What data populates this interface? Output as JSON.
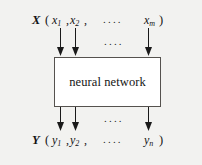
{
  "figure": {
    "background_color": "#f2f2f0",
    "box": {
      "label": "neural network",
      "fill_color": "#ffffff",
      "border_color": "#55524e"
    },
    "input_vector": {
      "name": "X",
      "open_paren": "(",
      "close_paren": ")",
      "terms": [
        {
          "base": "x",
          "sub": "1"
        },
        {
          "base": "x",
          "sub": "2"
        },
        {
          "base": "x",
          "sub": "m"
        }
      ],
      "comma": ",",
      "ellipsis": "...."
    },
    "output_vector": {
      "name": "Y",
      "open_paren": "(",
      "close_paren": ")",
      "terms": [
        {
          "base": "y",
          "sub": "1"
        },
        {
          "base": "y",
          "sub": "2"
        },
        {
          "base": "y",
          "sub": "n"
        }
      ],
      "comma": ",",
      "ellipsis": "...."
    },
    "input_arrows_ellipsis": "....",
    "output_arrows_ellipsis": "....",
    "arrow_color": "#1a1a1a",
    "input_arrows": [
      {
        "name": "input-arrow-1"
      },
      {
        "name": "input-arrow-2"
      },
      {
        "name": "input-arrow-m"
      }
    ],
    "output_arrows": [
      {
        "name": "output-arrow-1"
      },
      {
        "name": "output-arrow-2"
      },
      {
        "name": "output-arrow-n"
      }
    ]
  }
}
